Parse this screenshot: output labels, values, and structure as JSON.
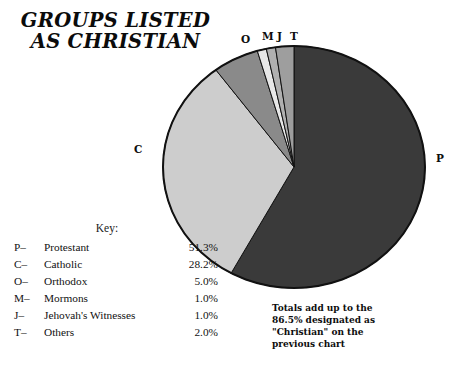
{
  "title": {
    "line1": "GROUPS LISTED",
    "line2": "AS CHRISTIAN"
  },
  "key": {
    "heading": "Key:",
    "columns": [
      "code",
      "label",
      "value"
    ],
    "rows": [
      {
        "code": "P–",
        "label": "Protestant",
        "value": "51.3%"
      },
      {
        "code": "C–",
        "label": "Catholic",
        "value": "28.2%"
      },
      {
        "code": "O–",
        "label": "Orthodox",
        "value": "5.0%"
      },
      {
        "code": "M–",
        "label": "Mormons",
        "value": "1.0%"
      },
      {
        "code": "J–",
        "label": "Jehovah's Witnesses",
        "value": "1.0%"
      },
      {
        "code": "T–",
        "label": "Others",
        "value": "2.0%"
      }
    ]
  },
  "slice_labels": {
    "p": "P",
    "c": "C",
    "o": "O",
    "m": "M",
    "j": "J",
    "t": "T"
  },
  "footnote": {
    "line1": "Totals add up to the",
    "line2": "86.5% designated as",
    "line3": "\"Christian\" on the",
    "line4": "previous chart"
  },
  "colors": {
    "background": "#ffffff",
    "text": "#111111",
    "outline": "#111111",
    "protestant": "#3a3a3a",
    "catholic": "#cdcdcd",
    "orthodox": "#8a8a8a",
    "mormons": "#e8e8e8",
    "jehovahs_witnesses": "#b0b0b0",
    "others": "#9e9e9e"
  },
  "chart_data": {
    "type": "pie",
    "title": "GROUPS LISTED AS CHRISTIAN",
    "total_labeled": "86.5%",
    "start_angle_deg": 0,
    "direction": "clockwise",
    "grid": false,
    "legend": "bottom-left",
    "labels": [
      "Protestant",
      "Catholic",
      "Orthodox",
      "Mormons",
      "Jehovah's Witnesses",
      "Others"
    ],
    "codes": [
      "P",
      "C",
      "O",
      "M",
      "J",
      "T"
    ],
    "values": [
      51.3,
      28.2,
      5.0,
      1.0,
      1.0,
      2.0
    ],
    "value_labels": [
      "51.3%",
      "28.2%",
      "5.0%",
      "1.0%",
      "1.0%",
      "2.0%"
    ],
    "slice_colors": [
      "#3a3a3a",
      "#cdcdcd",
      "#8a8a8a",
      "#e8e8e8",
      "#b0b0b0",
      "#9e9e9e"
    ],
    "annotation": "Totals add up to the 86.5% designated as \"Christian\" on the previous chart"
  }
}
